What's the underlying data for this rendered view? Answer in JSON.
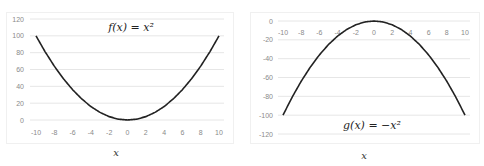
{
  "chart_data": [
    {
      "type": "line",
      "title": "f(x) = x²",
      "xlabel": "x",
      "ylabel": "",
      "x": [
        -10,
        -9,
        -8,
        -7,
        -6,
        -5,
        -4,
        -3,
        -2,
        -1,
        0,
        1,
        2,
        3,
        4,
        5,
        6,
        7,
        8,
        9,
        10
      ],
      "series": [
        {
          "name": "f(x) = x^2",
          "values": [
            100,
            81,
            64,
            49,
            36,
            25,
            16,
            9,
            4,
            1,
            0,
            1,
            4,
            9,
            16,
            25,
            36,
            49,
            64,
            81,
            100
          ]
        }
      ],
      "xticks": [
        "-10",
        "-8",
        "-6",
        "-4",
        "-2",
        "0",
        "2",
        "4",
        "6",
        "8",
        "10"
      ],
      "yticks": [
        "0",
        "20",
        "40",
        "60",
        "80",
        "100",
        "120"
      ],
      "ylim": [
        0,
        120
      ],
      "xlim": [
        -10,
        10
      ],
      "grid": true,
      "line_color": "#222222"
    },
    {
      "type": "line",
      "title": "g(x) = −x²",
      "xlabel": "x",
      "ylabel": "",
      "x": [
        -10,
        -9,
        -8,
        -7,
        -6,
        -5,
        -4,
        -3,
        -2,
        -1,
        0,
        1,
        2,
        3,
        4,
        5,
        6,
        7,
        8,
        9,
        10
      ],
      "series": [
        {
          "name": "g(x) = -x^2",
          "values": [
            -100,
            -81,
            -64,
            -49,
            -36,
            -25,
            -16,
            -9,
            -4,
            -1,
            0,
            -1,
            -4,
            -9,
            -16,
            -25,
            -36,
            -49,
            -64,
            -81,
            -100
          ]
        }
      ],
      "xticks": [
        "-10",
        "-8",
        "-6",
        "-4",
        "-2",
        "0",
        "2",
        "4",
        "6",
        "8",
        "10"
      ],
      "yticks": [
        "0",
        "-20",
        "-40",
        "-60",
        "-80",
        "-100",
        "-120"
      ],
      "ylim": [
        -120,
        0
      ],
      "xlim": [
        -10,
        10
      ],
      "grid": true,
      "line_color": "#222222"
    }
  ]
}
